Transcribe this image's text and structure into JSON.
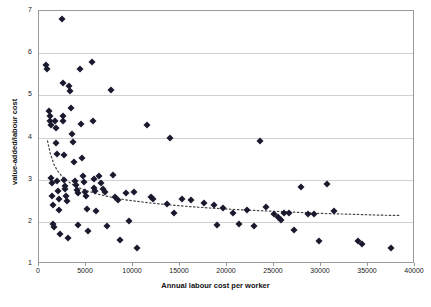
{
  "chart_data": {
    "type": "scatter",
    "title": "",
    "xlabel": "Annual labour cost per worker",
    "ylabel": "value-added/labour cost",
    "xlim": [
      0,
      40000
    ],
    "ylim": [
      1,
      7
    ],
    "xticks": [
      0,
      5000,
      10000,
      15000,
      20000,
      25000,
      30000,
      35000,
      40000
    ],
    "yticks": [
      1,
      2,
      3,
      4,
      5,
      6,
      7
    ],
    "xticklabels": [
      "0",
      "5000",
      "10000",
      "15000",
      "20000",
      "25000",
      "30000",
      "35000",
      "40000"
    ],
    "yticklabels": [
      "1",
      "2",
      "3",
      "4",
      "5",
      "6",
      "7"
    ],
    "grid": "horizontal",
    "legend": "none",
    "series": [
      {
        "name": "firms",
        "marker": "diamond",
        "color": "#1a1a2e",
        "points": [
          [
            700,
            5.72
          ],
          [
            900,
            5.62
          ],
          [
            1050,
            4.62
          ],
          [
            1150,
            4.52
          ],
          [
            1200,
            4.38
          ],
          [
            1250,
            4.3
          ],
          [
            1300,
            3.05
          ],
          [
            1350,
            2.92
          ],
          [
            1400,
            2.62
          ],
          [
            1450,
            2.4
          ],
          [
            1500,
            1.95
          ],
          [
            1600,
            1.88
          ],
          [
            1750,
            4.38
          ],
          [
            1800,
            4.22
          ],
          [
            1850,
            3.88
          ],
          [
            1900,
            3.62
          ],
          [
            1950,
            2.98
          ],
          [
            2000,
            2.72
          ],
          [
            2100,
            2.55
          ],
          [
            2150,
            2.28
          ],
          [
            2200,
            1.72
          ],
          [
            2400,
            6.8
          ],
          [
            2500,
            5.3
          ],
          [
            2550,
            4.5
          ],
          [
            2600,
            4.4
          ],
          [
            2650,
            3.58
          ],
          [
            2700,
            3.0
          ],
          [
            2750,
            2.85
          ],
          [
            2800,
            2.78
          ],
          [
            2900,
            2.62
          ],
          [
            3000,
            2.5
          ],
          [
            3100,
            1.62
          ],
          [
            3200,
            5.22
          ],
          [
            3300,
            5.1
          ],
          [
            3400,
            4.7
          ],
          [
            3500,
            4.08
          ],
          [
            3600,
            3.9
          ],
          [
            3700,
            3.42
          ],
          [
            3800,
            2.98
          ],
          [
            3900,
            2.88
          ],
          [
            4000,
            2.76
          ],
          [
            4100,
            2.68
          ],
          [
            4200,
            1.92
          ],
          [
            4400,
            5.62
          ],
          [
            4500,
            4.32
          ],
          [
            4600,
            3.52
          ],
          [
            4700,
            3.08
          ],
          [
            4800,
            2.95
          ],
          [
            4900,
            2.7
          ],
          [
            5000,
            2.62
          ],
          [
            5100,
            2.3
          ],
          [
            5200,
            1.78
          ],
          [
            5600,
            5.78
          ],
          [
            5700,
            4.4
          ],
          [
            5800,
            3.02
          ],
          [
            5900,
            2.8
          ],
          [
            6000,
            2.72
          ],
          [
            6100,
            2.25
          ],
          [
            6400,
            3.08
          ],
          [
            6600,
            2.92
          ],
          [
            6800,
            2.78
          ],
          [
            7000,
            2.7
          ],
          [
            7200,
            1.9
          ],
          [
            7700,
            5.12
          ],
          [
            7900,
            3.1
          ],
          [
            8100,
            2.58
          ],
          [
            8400,
            2.52
          ],
          [
            8600,
            1.58
          ],
          [
            9300,
            2.68
          ],
          [
            9600,
            2.02
          ],
          [
            10100,
            2.7
          ],
          [
            10400,
            1.38
          ],
          [
            11500,
            4.3
          ],
          [
            11900,
            2.58
          ],
          [
            12100,
            2.55
          ],
          [
            13600,
            2.42
          ],
          [
            13900,
            3.98
          ],
          [
            14400,
            2.22
          ],
          [
            15200,
            2.55
          ],
          [
            16200,
            2.52
          ],
          [
            17500,
            2.45
          ],
          [
            18600,
            2.4
          ],
          [
            18900,
            1.92
          ],
          [
            19600,
            2.32
          ],
          [
            20600,
            2.22
          ],
          [
            21300,
            1.95
          ],
          [
            22100,
            2.28
          ],
          [
            22900,
            1.9
          ],
          [
            23500,
            3.92
          ],
          [
            24100,
            2.35
          ],
          [
            25000,
            2.18
          ],
          [
            25400,
            2.12
          ],
          [
            25700,
            2.05
          ],
          [
            26100,
            2.2
          ],
          [
            26600,
            2.2
          ],
          [
            27100,
            1.8
          ],
          [
            27900,
            2.82
          ],
          [
            28600,
            2.18
          ],
          [
            29300,
            2.18
          ],
          [
            29800,
            1.55
          ],
          [
            30600,
            2.9
          ],
          [
            31400,
            2.25
          ],
          [
            33900,
            1.55
          ],
          [
            34400,
            1.48
          ],
          [
            37400,
            1.38
          ]
        ]
      }
    ],
    "trendline": {
      "name": "power-fit dotted trend",
      "style": "dotted",
      "color": "#444444",
      "points": [
        [
          900,
          3.92
        ],
        [
          1200,
          3.62
        ],
        [
          1600,
          3.36
        ],
        [
          2000,
          3.2
        ],
        [
          2600,
          3.04
        ],
        [
          3200,
          2.94
        ],
        [
          4000,
          2.83
        ],
        [
          5000,
          2.74
        ],
        [
          6200,
          2.66
        ],
        [
          7600,
          2.59
        ],
        [
          9200,
          2.52
        ],
        [
          11000,
          2.47
        ],
        [
          13000,
          2.42
        ],
        [
          15500,
          2.37
        ],
        [
          18000,
          2.33
        ],
        [
          21000,
          2.29
        ],
        [
          24000,
          2.26
        ],
        [
          27000,
          2.23
        ],
        [
          30000,
          2.2
        ],
        [
          33000,
          2.18
        ],
        [
          36000,
          2.16
        ],
        [
          38500,
          2.15
        ]
      ]
    }
  }
}
